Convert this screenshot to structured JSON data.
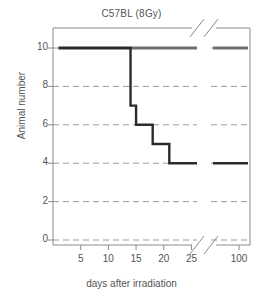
{
  "chart_data": {
    "type": "line",
    "title": "C57BL (8Gy)",
    "xlabel": "days after irradiation",
    "ylabel": "Animal number",
    "xlim": [
      0,
      26
    ],
    "ylim": [
      0,
      11
    ],
    "xticks": [
      5,
      10,
      15,
      20,
      25
    ],
    "xticklabels": [
      "5",
      "10",
      "15",
      "20",
      "25"
    ],
    "yticks": [
      0,
      2,
      4,
      6,
      8,
      10
    ],
    "yticklabels": [
      "0",
      "2",
      "4",
      "6",
      "8",
      "10"
    ],
    "grid": "horizontal-dashed",
    "legend": "none",
    "axis_break": {
      "x_break_after": 26,
      "right_panel_ticks": [
        100
      ],
      "right_panel_ticklabels": [
        "100"
      ],
      "marker": "diagonal-slash"
    },
    "series": [
      {
        "name": "control",
        "color": "#6e6e6e",
        "style": "step",
        "points": [
          {
            "x": 1,
            "y": 10
          },
          {
            "x": 26,
            "y": 10
          },
          {
            "x": 100,
            "y": 10
          }
        ]
      },
      {
        "name": "irradiated",
        "color": "#2b2b2b",
        "style": "step",
        "points": [
          {
            "x": 1,
            "y": 10
          },
          {
            "x": 14,
            "y": 10
          },
          {
            "x": 14,
            "y": 7
          },
          {
            "x": 15,
            "y": 7
          },
          {
            "x": 15,
            "y": 6
          },
          {
            "x": 18,
            "y": 6
          },
          {
            "x": 18,
            "y": 5
          },
          {
            "x": 21,
            "y": 5
          },
          {
            "x": 21,
            "y": 4
          },
          {
            "x": 26,
            "y": 4
          },
          {
            "x": 100,
            "y": 4
          }
        ]
      }
    ]
  }
}
